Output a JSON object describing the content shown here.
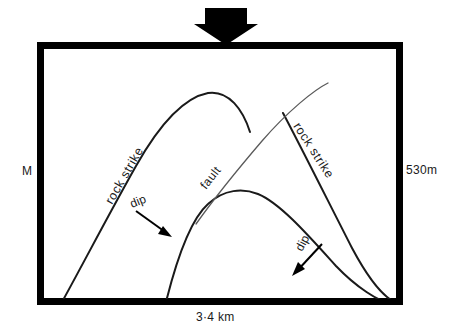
{
  "figure": {
    "type": "geological-structure-map",
    "background_color": "#ffffff",
    "frame_color": "#000000",
    "line_color": "#1a1a1a",
    "fault_line_color": "#5a5a5a"
  },
  "scale_labels": {
    "left": "M",
    "right": "530m",
    "bottom": "3·4 km"
  },
  "annotations": {
    "rock_strike_left": "rock strike",
    "rock_strike_right": "rock strike",
    "fault": "fault",
    "dip_left": "dip",
    "dip_right": "dip"
  },
  "icons": {
    "north_arrow": "down-arrow-icon",
    "dip_arrow_left": "arrow-down-right-icon",
    "dip_arrow_right": "arrow-down-left-icon"
  },
  "geometry": {
    "frame": {
      "x": 37,
      "y": 42,
      "width": 366,
      "height": 263,
      "stroke_width": 7
    },
    "north_arrow": {
      "x": 224,
      "y": 8,
      "width": 44,
      "height": 34
    },
    "folds": [
      {
        "name": "upper-anticline",
        "crest_x": 208,
        "crest_y": 93
      },
      {
        "name": "lower-anticline",
        "crest_x": 248,
        "crest_y": 190
      },
      {
        "name": "right-limb",
        "top_x": 283,
        "top_y": 113
      }
    ],
    "fault": {
      "start_x": 196,
      "start_y": 222,
      "end_x": 328,
      "end_y": 83
    }
  }
}
